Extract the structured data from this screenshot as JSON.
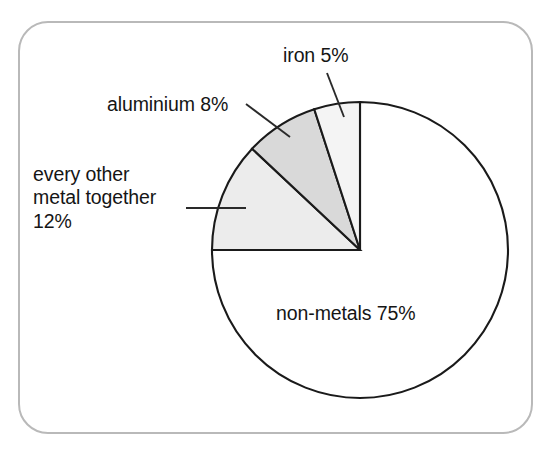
{
  "figure": {
    "name": "composition-pie-chart",
    "frame_border_color": "#b9b9b9",
    "background_color": "#ffffff",
    "outline_color": "#1a1a1a"
  },
  "chart_data": {
    "type": "pie",
    "title": "",
    "xlabel": "",
    "ylabel": "",
    "legend_position": "none",
    "grid": false,
    "total": 100,
    "units": "%",
    "start_angle_deg": 0,
    "direction": "counter-clockwise",
    "categories": [
      "iron",
      "aluminium",
      "every other metal together",
      "non-metals"
    ],
    "values": [
      5,
      8,
      12,
      75
    ],
    "labels": [
      "iron 5%",
      "aluminium 8%",
      "every other\nmetal together\n12%",
      "non-metals 75%"
    ],
    "colors": [
      "#f4f4f4",
      "#d9d9d9",
      "#ececec",
      "#ffffff"
    ],
    "slices": [
      {
        "key": "iron",
        "name": "iron",
        "value": 5,
        "label": "iron 5%",
        "color": "#f4f4f4",
        "start_deg": 0,
        "end_deg": 18,
        "label_placement": "outside-top",
        "has_leader_line": true
      },
      {
        "key": "aluminium",
        "name": "aluminium",
        "value": 8,
        "label": "aluminium 8%",
        "color": "#d9d9d9",
        "start_deg": 18,
        "end_deg": 46.8,
        "label_placement": "outside-upper-left",
        "has_leader_line": true
      },
      {
        "key": "every-other-metal",
        "name": "every other metal together",
        "value": 12,
        "label_line_1": "every other",
        "label_line_2": "metal together",
        "label_line_3": "12%",
        "color": "#ececec",
        "start_deg": 46.8,
        "end_deg": 90,
        "label_placement": "outside-left",
        "has_leader_line": true
      },
      {
        "key": "non-metals",
        "name": "non-metals",
        "value": 75,
        "label": "non-metals 75%",
        "color": "#ffffff",
        "start_deg": 90,
        "end_deg": 360,
        "label_placement": "inside",
        "has_leader_line": false
      }
    ]
  }
}
